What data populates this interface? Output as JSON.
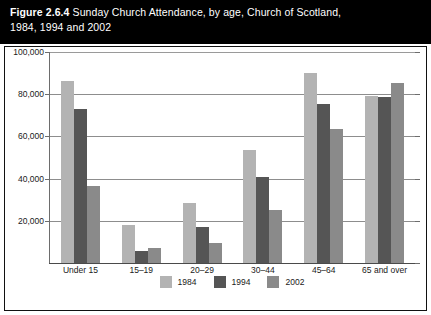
{
  "title": {
    "figure_number": "Figure 2.6.4",
    "line1_rest": " Sunday Church Attendance, by age, Church of Scotland,",
    "line2": "1984, 1994 and 2002"
  },
  "chart_data": {
    "type": "bar",
    "title": "Figure 2.6.4 Sunday Church Attendance, by age, Church of Scotland, 1984, 1994 and 2002",
    "xlabel": "",
    "ylabel": "",
    "categories": [
      "Under 15",
      "15–19",
      "20–29",
      "30–44",
      "45–64",
      "65 and over"
    ],
    "series": [
      {
        "name": "1984",
        "color": "#b3b3b3",
        "values": [
          86500,
          18000,
          28500,
          53500,
          90000,
          79000
        ]
      },
      {
        "name": "1994",
        "color": "#555555",
        "values": [
          73000,
          5500,
          17000,
          41000,
          75500,
          78500
        ]
      },
      {
        "name": "2002",
        "color": "#8a8a8a",
        "values": [
          36500,
          7000,
          9500,
          25000,
          63500,
          85500
        ]
      }
    ],
    "ylim": [
      0,
      100000
    ],
    "yticks": [
      0,
      20000,
      40000,
      60000,
      80000,
      100000
    ],
    "ytick_labels": [
      "",
      "20,000",
      "40,000",
      "60,000",
      "80,000",
      "100,000"
    ],
    "grid": true,
    "legend_position": "bottom"
  }
}
